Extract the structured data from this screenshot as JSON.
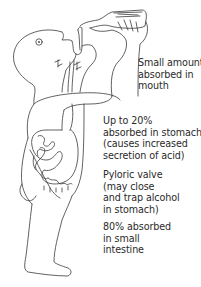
{
  "diagram": {
    "figure": "person-drinking-from-bottle",
    "annotations": [
      {
        "id": "mouth",
        "lines": [
          "Small amounts",
          "absorbed in",
          "mouth"
        ]
      },
      {
        "id": "stomach",
        "lines": [
          "Up to 20%",
          "absorbed in stomach",
          "(causes increased",
          "secretion of acid)"
        ]
      },
      {
        "id": "pyloric",
        "lines": [
          "Pyloric valve",
          "(may close",
          "and trap alcohol",
          "in stomach)"
        ]
      },
      {
        "id": "intestine",
        "lines": [
          "80% absorbed",
          "in small",
          "intestine"
        ]
      }
    ],
    "colors": {
      "background": "#ffffff",
      "line": "#3a3a3a",
      "text": "#2a2a2a"
    }
  }
}
